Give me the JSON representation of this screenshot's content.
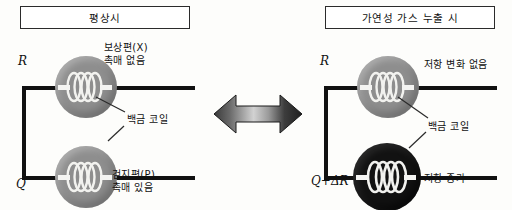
{
  "diagram": {
    "kind": "catalytic-combustion-gas-sensor-bridge",
    "panels": [
      {
        "id": "normal",
        "title": "평상시",
        "top_branch": {
          "terminal": "R",
          "bead_color": "#8e8e8e",
          "bead_state": "grey",
          "label_lines": [
            "보상편(X)",
            "촉매 없음"
          ],
          "callout": "백금 코일"
        },
        "bottom_branch": {
          "terminal": "Q",
          "bead_color": "#8e8e8e",
          "bead_state": "grey",
          "label_lines": [
            "검지편(P)",
            "촉매 있음"
          ],
          "callout": ""
        }
      },
      {
        "id": "gas-leak",
        "title": "가연성 가스 누출 시",
        "top_branch": {
          "terminal": "R",
          "bead_color": "#8e8e8e",
          "bead_state": "grey",
          "label_lines": [
            "저항 변화 없음"
          ],
          "callout": "백금 코일"
        },
        "bottom_branch": {
          "terminal": "Q+ΔR",
          "bead_color": "#121212",
          "bead_state": "black",
          "label_lines": [
            "저항 증가"
          ],
          "callout": ""
        }
      }
    ],
    "center_arrow": {
      "name": "double-headed-arrow",
      "direction": "left-right",
      "fill_light": "#bdbdbd",
      "fill_dark": "#2e2e2e"
    },
    "colors": {
      "wire": "#111111",
      "bead_grey": "#8e8e8e",
      "bead_black": "#121212",
      "coil": "#f2f2ef",
      "border": "#2b2b2b",
      "background": "#fdfdfb"
    }
  }
}
